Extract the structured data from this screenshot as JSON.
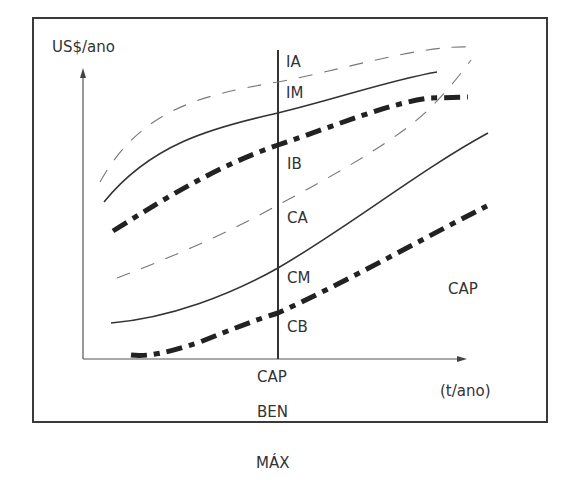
{
  "axes": {
    "y_label": "US$/ano",
    "x_label": "(t/ano)"
  },
  "vertical_line": {
    "label_top": "CAP",
    "label_bottom": "BEN",
    "below_frame": "MÁX"
  },
  "curve_labels": {
    "ia": "IA",
    "im": "IM",
    "ib": "IB",
    "ca": "CA",
    "cm": "CM",
    "cb": "CB"
  },
  "region_label": "CAP",
  "legend": {
    "high_style": "thin dashed",
    "medium_style": "solid",
    "low_style": "thick dash-dot"
  },
  "colors": {
    "line": "#333333",
    "background": "#ffffff"
  }
}
